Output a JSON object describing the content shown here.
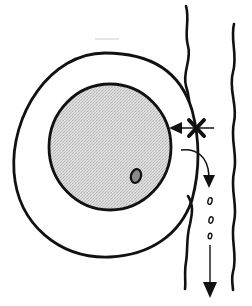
{
  "diagram": {
    "type": "schematic",
    "elements": {
      "outer_membrane": {
        "shape": "ellipse",
        "cx": 106,
        "cy": 155,
        "rx": 94,
        "ry": 102,
        "fill": "#ffffff",
        "stroke": "#111111"
      },
      "inner_body": {
        "shape": "ellipse",
        "cx": 110,
        "cy": 147,
        "rx": 61,
        "ry": 64,
        "fill": "#d6d6d6",
        "stroke": "#111111"
      },
      "inclusion": {
        "shape": "ellipse",
        "cx": 136,
        "cy": 176,
        "rx": 5,
        "ry": 7,
        "fill": "#8a8a8a",
        "stroke": "#111111"
      },
      "block_marker": {
        "symbol": "X",
        "x": 196,
        "y": 128,
        "meaning": "blocked"
      },
      "blocked_arrow": {
        "from": [
          214,
          128
        ],
        "to": [
          170,
          128
        ],
        "direction": "left"
      },
      "release_arrow": {
        "from": [
          182,
          150
        ],
        "to": [
          210,
          185
        ],
        "direction": "down"
      },
      "droplets": [
        {
          "cx": 210,
          "cy": 201
        },
        {
          "cx": 211,
          "cy": 220
        },
        {
          "cx": 210,
          "cy": 236
        }
      ],
      "flow_arrow": {
        "from": [
          210,
          246
        ],
        "to": [
          210,
          296
        ],
        "direction": "down"
      },
      "channel_walls": [
        "left-wavy-wall",
        "right-wavy-wall"
      ]
    },
    "colors": {
      "stroke": "#111111",
      "inner_fill": "#d6d6d6",
      "inclusion_fill": "#8a8a8a",
      "background": "#ffffff"
    }
  }
}
